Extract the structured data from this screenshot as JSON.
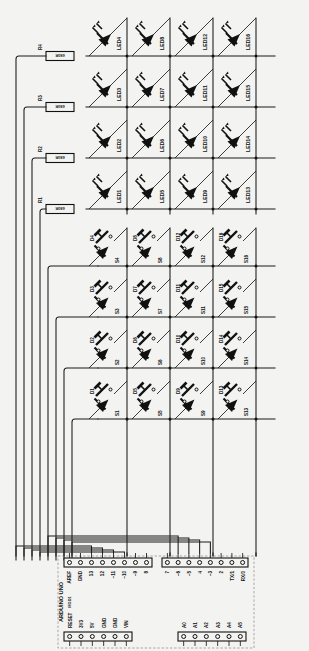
{
  "sheet": {
    "background": "#f3f3f1",
    "ink": "#111111"
  },
  "resistors": [
    {
      "ref": "R1",
      "value": "680R"
    },
    {
      "ref": "R2",
      "value": "680R"
    },
    {
      "ref": "R3",
      "value": "680R"
    },
    {
      "ref": "R4",
      "value": "680R"
    }
  ],
  "leds": [
    {
      "ref": "LED1"
    },
    {
      "ref": "LED2"
    },
    {
      "ref": "LED3"
    },
    {
      "ref": "LED4"
    },
    {
      "ref": "LED5"
    },
    {
      "ref": "LED6"
    },
    {
      "ref": "LED7"
    },
    {
      "ref": "LED8"
    },
    {
      "ref": "LED9"
    },
    {
      "ref": "LED10"
    },
    {
      "ref": "LED11"
    },
    {
      "ref": "LED12"
    },
    {
      "ref": "LED13"
    },
    {
      "ref": "LED14"
    },
    {
      "ref": "LED15"
    },
    {
      "ref": "LED16"
    }
  ],
  "diodes": [
    {
      "ref": "D1"
    },
    {
      "ref": "D2"
    },
    {
      "ref": "D3"
    },
    {
      "ref": "D4"
    },
    {
      "ref": "D5"
    },
    {
      "ref": "D6"
    },
    {
      "ref": "D7"
    },
    {
      "ref": "D8"
    },
    {
      "ref": "D9"
    },
    {
      "ref": "D10"
    },
    {
      "ref": "D11"
    },
    {
      "ref": "D12"
    },
    {
      "ref": "D13"
    },
    {
      "ref": "D14"
    },
    {
      "ref": "D15"
    },
    {
      "ref": "D16"
    }
  ],
  "switches": [
    {
      "ref": "S1"
    },
    {
      "ref": "S2"
    },
    {
      "ref": "S3"
    },
    {
      "ref": "S4"
    },
    {
      "ref": "S5"
    },
    {
      "ref": "S6"
    },
    {
      "ref": "S7"
    },
    {
      "ref": "S8"
    },
    {
      "ref": "S9"
    },
    {
      "ref": "S10"
    },
    {
      "ref": "S11"
    },
    {
      "ref": "S12"
    },
    {
      "ref": "S13"
    },
    {
      "ref": "S14"
    },
    {
      "ref": "S15"
    },
    {
      "ref": "S16"
    }
  ],
  "module": {
    "name": "ARDUINO UNO",
    "designator": "MOD1",
    "header_top_left": {
      "pins": [
        "AREF",
        "GND",
        "13",
        "12",
        "~11",
        "~10",
        "~9",
        "8"
      ]
    },
    "header_top_right": {
      "pins": [
        "7",
        "~6",
        "~5",
        "4",
        "~3",
        "2",
        "TX/1",
        "RX/0"
      ]
    },
    "header_bottom_left": {
      "pins": [
        "RESET",
        "3V3",
        "5V",
        "GND",
        "GND",
        "VIN"
      ]
    },
    "header_bottom_right": {
      "pins": [
        "A0",
        "A1",
        "A2",
        "A3",
        "A4",
        "A5"
      ]
    }
  }
}
